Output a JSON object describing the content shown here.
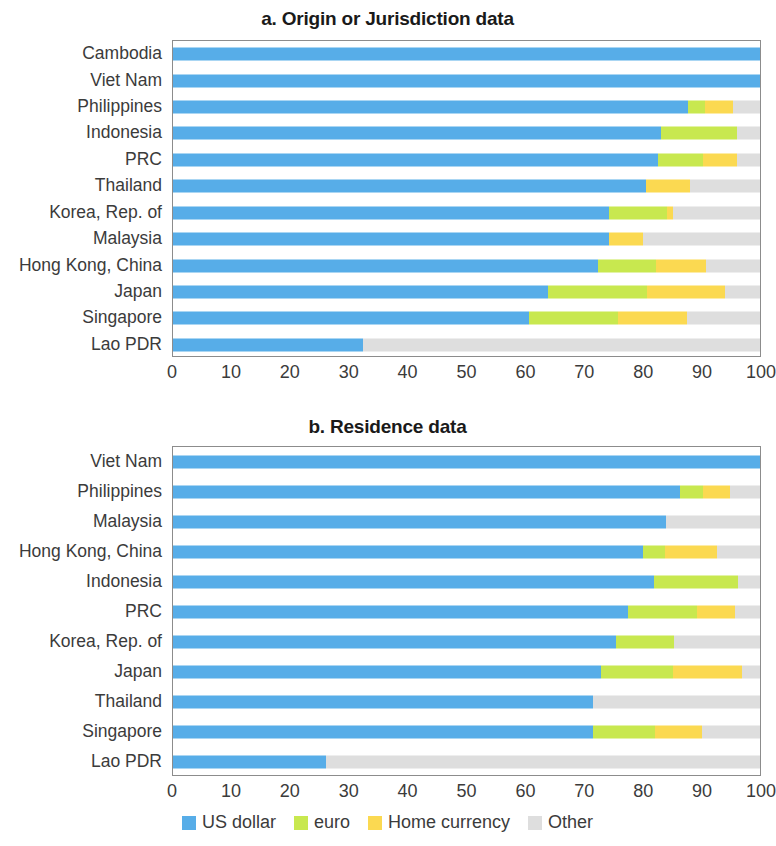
{
  "figure": {
    "legend": {
      "items": [
        {
          "label": "US dollar",
          "color": "#57ade8",
          "key": "usd"
        },
        {
          "label": "euro",
          "color": "#c8e84f",
          "key": "eur"
        },
        {
          "label": "Home currency",
          "color": "#fbd951",
          "key": "home"
        },
        {
          "label": "Other",
          "color": "#dedede",
          "key": "other"
        }
      ]
    }
  },
  "chart_data": [
    {
      "type": "bar",
      "orientation": "horizontal",
      "stacked": true,
      "normalized": true,
      "title": "a. Origin or Jurisdiction data",
      "xlabel": "",
      "ylabel": "",
      "xlim": [
        0,
        100
      ],
      "xticks": [
        "0",
        "10",
        "20",
        "30",
        "40",
        "50",
        "60",
        "70",
        "80",
        "90",
        "100"
      ],
      "grid": false,
      "legend_position": "bottom",
      "categories": [
        "Cambodia",
        "Viet Nam",
        "Philippines",
        "Indonesia",
        "PRC",
        "Thailand",
        "Korea, Rep. of",
        "Malaysia",
        "Hong Kong, China",
        "Japan",
        "Singapore",
        "Lao PDR"
      ],
      "series": [
        {
          "name": "US dollar",
          "color": "#57ade8",
          "values": [
            100,
            100,
            87.7,
            83.2,
            82.6,
            80.6,
            74.3,
            74.3,
            72.4,
            63.9,
            60.6,
            32.4
          ]
        },
        {
          "name": "euro",
          "color": "#c8e84f",
          "values": [
            0,
            0,
            2.9,
            12.8,
            7.7,
            0,
            9.9,
            0,
            9.9,
            16.8,
            15.2,
            0
          ]
        },
        {
          "name": "Home currency",
          "color": "#fbd951",
          "values": [
            0,
            0,
            4.8,
            0,
            5.7,
            7.5,
            1.0,
            5.8,
            8.5,
            13.3,
            11.8,
            0
          ]
        },
        {
          "name": "Other",
          "color": "#dedede",
          "values": [
            0,
            0,
            4.6,
            4.0,
            4.0,
            11.9,
            14.8,
            19.9,
            9.2,
            6.0,
            12.4,
            67.6
          ]
        }
      ]
    },
    {
      "type": "bar",
      "orientation": "horizontal",
      "stacked": true,
      "normalized": true,
      "title": "b. Residence data",
      "xlabel": "",
      "ylabel": "",
      "xlim": [
        0,
        100
      ],
      "xticks": [
        "0",
        "10",
        "20",
        "30",
        "40",
        "50",
        "60",
        "70",
        "80",
        "90",
        "100"
      ],
      "grid": false,
      "legend_position": "bottom",
      "categories": [
        "Viet Nam",
        "Philippines",
        "Malaysia",
        "Hong Kong, China",
        "Indonesia",
        "PRC",
        "Korea, Rep. of",
        "Japan",
        "Thailand",
        "Singapore",
        "Lao PDR"
      ],
      "series": [
        {
          "name": "US dollar",
          "color": "#57ade8",
          "values": [
            100,
            86.4,
            84.0,
            80.1,
            82.0,
            77.5,
            75.5,
            72.9,
            71.6,
            71.6,
            26.1
          ]
        },
        {
          "name": "euro",
          "color": "#c8e84f",
          "values": [
            0,
            3.9,
            0,
            3.7,
            14.3,
            11.8,
            9.9,
            12.3,
            0,
            10.5,
            0
          ]
        },
        {
          "name": "Home currency",
          "color": "#fbd951",
          "values": [
            0,
            4.6,
            0,
            8.9,
            0,
            6.4,
            0,
            11.8,
            0,
            8.0,
            0
          ]
        },
        {
          "name": "Other",
          "color": "#dedede",
          "values": [
            0,
            5.1,
            16.0,
            7.3,
            3.7,
            4.3,
            14.6,
            3.0,
            28.4,
            9.9,
            73.9
          ]
        }
      ]
    }
  ]
}
